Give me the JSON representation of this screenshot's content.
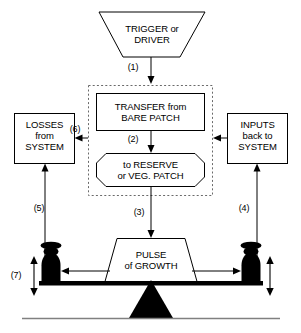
{
  "diagram": {
    "type": "flow-diagram",
    "colors": {
      "stroke": "#000000",
      "fill": "#ffffff",
      "solid": "#000000",
      "dashed_boundary": "#555555",
      "ground": "#777777"
    },
    "nodes": {
      "trigger": {
        "line1": "TRIGGER or",
        "line2": "DRIVER",
        "shape": "inverted-trapezoid"
      },
      "transfer": {
        "line1": "TRANSFER from",
        "line2": "BARE PATCH",
        "shape": "rectangle"
      },
      "reserve": {
        "line1": "to RESERVE",
        "line2": "or VEG. PATCH",
        "shape": "octagon"
      },
      "losses": {
        "line1": "LOSSES",
        "line2": "from",
        "line3": "SYSTEM",
        "shape": "rectangle"
      },
      "inputs": {
        "line1": "INPUTS",
        "line2": "back to",
        "line3": "SYSTEM",
        "shape": "rectangle"
      },
      "pulse": {
        "line1": "PULSE",
        "line2": "of GROWTH",
        "shape": "trapezoid"
      }
    },
    "flow_labels": {
      "f1": "(1)",
      "f2": "(2)",
      "f3": "(3)",
      "f4": "(4)",
      "f5": "(5)",
      "f6": "(6)",
      "f7": "(7)"
    },
    "elements": {
      "dashed_boundary": "dashed-region",
      "fulcrum": "triangle-fulcrum",
      "left_weight": "pawn-weight-left",
      "right_weight": "pawn-weight-right",
      "beam": "balance-beam",
      "ground_line": "ground-line"
    }
  }
}
